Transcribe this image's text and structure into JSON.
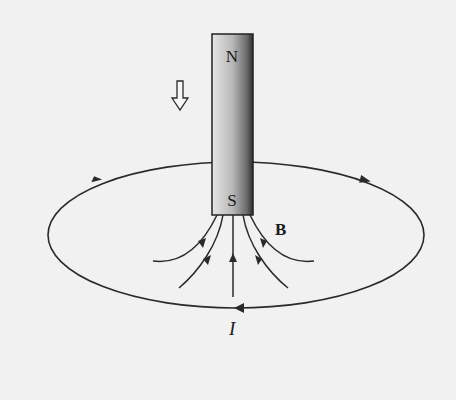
{
  "diagram": {
    "magnet": {
      "north_label": "N",
      "south_label": "S"
    },
    "field_label": "B",
    "current_label": "I",
    "motion_arrow": "down-arrow",
    "colors": {
      "background": "#f1f1f1",
      "line": "#2a2a2a"
    }
  }
}
